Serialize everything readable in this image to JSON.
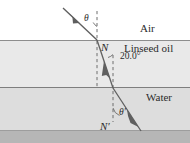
{
  "diagram": {
    "media": [
      {
        "name": "air",
        "label": "Air",
        "fill": "#ffffff"
      },
      {
        "name": "linseed-oil",
        "label": "Linseed oil",
        "fill": "#e8e8e8"
      },
      {
        "name": "water",
        "label": "Water",
        "fill": "#dcdcdc"
      }
    ],
    "labels": {
      "air": "Air",
      "linseed_oil": "Linseed oil",
      "water": "Water",
      "normal_upper": "N",
      "normal_lower": "N′",
      "incident_angle": "θ",
      "refracted_angle": "θ′",
      "oil_angle_value": "20.0°"
    },
    "geometry": {
      "boundary_air_oil_y": 40,
      "boundary_oil_water_y": 87,
      "footer_band_y": 130,
      "normal_upper_x": 97,
      "normal_lower_x": 113,
      "ray_incident_start": [
        63,
        8
      ],
      "ray_hit_air_oil": [
        97,
        40
      ],
      "ray_hit_oil_water": [
        113,
        88
      ],
      "ray_exit_end": [
        141,
        131
      ]
    },
    "colors": {
      "ray": "#5f5f5f",
      "normal_dash": "#6e6e6e",
      "boundary": "#8a8a8a",
      "text": "#2b2b2b",
      "footer_band": "#b4b4b4"
    }
  }
}
